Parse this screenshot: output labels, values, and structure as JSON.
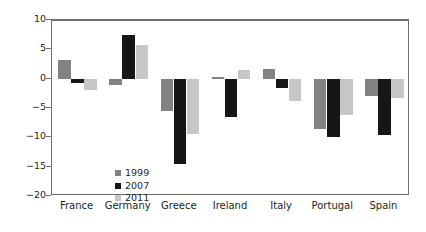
{
  "chart_data": {
    "type": "bar",
    "title": "",
    "xlabel": "",
    "ylabel": "Percent of GDP",
    "categories": [
      "France",
      "Germany",
      "Greece",
      "Ireland",
      "Italy",
      "Portugal",
      "Spain"
    ],
    "series": [
      {
        "name": "1999",
        "color": "#808285",
        "values": [
          3.2,
          -1.0,
          -5.5,
          0.3,
          1.7,
          -8.5,
          -3.0
        ]
      },
      {
        "name": "2007",
        "color": "#161616",
        "values": [
          -0.8,
          7.5,
          -14.6,
          -6.5,
          -1.6,
          -10.0,
          -9.6
        ]
      },
      {
        "name": "2011",
        "color": "#c5c6c8",
        "values": [
          -1.9,
          5.8,
          -9.5,
          1.5,
          -3.8,
          -6.2,
          -3.3
        ]
      }
    ],
    "ylim": [
      -20,
      10
    ],
    "yticks": [
      10,
      5,
      0,
      -5,
      -10,
      -15,
      -20
    ],
    "ytick_labels": [
      "10",
      "5",
      "0",
      "−5",
      "−10",
      "−15",
      "−20"
    ],
    "grid": false,
    "legend_position": "inside-lower-left",
    "zero_line": true
  }
}
